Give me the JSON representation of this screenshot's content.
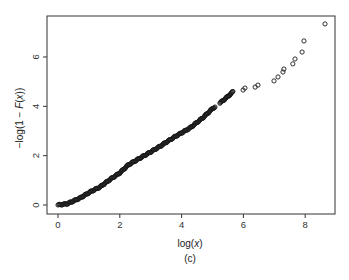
{
  "chart_data": {
    "type": "scatter",
    "title": "",
    "caption": "(c)",
    "xlabel_parts": [
      "log(",
      "x",
      ")"
    ],
    "ylabel_parts": [
      "−log(1 − ",
      "F",
      "(",
      "x",
      "))"
    ],
    "xlim": [
      -0.2,
      9.0
    ],
    "ylim": [
      -0.35,
      7.5
    ],
    "x_ticks": [
      0,
      2,
      4,
      6,
      8
    ],
    "y_ticks": [
      0,
      2,
      4,
      6
    ],
    "x_tick_labels": [
      "0",
      "2",
      "4",
      "6",
      "8"
    ],
    "y_tick_labels": [
      "0",
      "2",
      "4",
      "6"
    ],
    "grid": false,
    "legend": "none",
    "marker": "open-circle",
    "color": "#1a1a1a",
    "dense_segments": [
      [
        [
          0.0,
          0.0
        ],
        [
          0.3,
          0.05
        ],
        [
          0.71,
          0.28
        ],
        [
          1.04,
          0.53
        ],
        [
          1.36,
          0.73
        ],
        [
          1.7,
          1.05
        ],
        [
          2.0,
          1.3
        ],
        [
          2.27,
          1.62
        ],
        [
          2.65,
          1.9
        ],
        [
          3.0,
          2.15
        ],
        [
          3.37,
          2.43
        ],
        [
          3.46,
          2.51
        ],
        [
          3.8,
          2.78
        ],
        [
          4.27,
          3.12
        ],
        [
          4.7,
          3.55
        ],
        [
          5.02,
          3.93
        ],
        [
          5.08,
          3.97
        ]
      ],
      [
        [
          5.24,
          4.13
        ],
        [
          5.45,
          4.35
        ],
        [
          5.63,
          4.55
        ],
        [
          5.66,
          4.6
        ]
      ]
    ],
    "points": [
      [
        5.99,
        4.66
      ],
      [
        6.05,
        4.74
      ],
      [
        6.38,
        4.78
      ],
      [
        6.47,
        4.86
      ],
      [
        6.99,
        5.03
      ],
      [
        7.12,
        5.19
      ],
      [
        7.28,
        5.39
      ],
      [
        7.31,
        5.51
      ],
      [
        7.6,
        5.72
      ],
      [
        7.67,
        5.92
      ],
      [
        7.9,
        6.2
      ],
      [
        7.96,
        6.65
      ],
      [
        8.64,
        7.34
      ]
    ]
  }
}
